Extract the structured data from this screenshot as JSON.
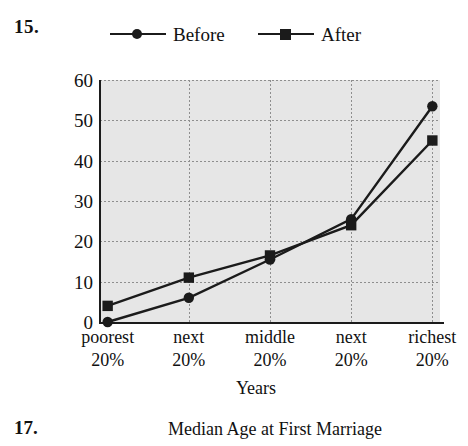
{
  "question_number": "15.",
  "legend": {
    "items": [
      {
        "label": "Before",
        "marker": "circle-marker-icon",
        "color": "#1b1b1b"
      },
      {
        "label": "After",
        "marker": "square-marker-icon",
        "color": "#1b1b1b"
      }
    ]
  },
  "axis": {
    "y_ticks": [
      "60",
      "50",
      "40",
      "30",
      "20",
      "10",
      "0"
    ],
    "x_title": "Years"
  },
  "x_categories": [
    {
      "line1": "poorest",
      "line2": "20%"
    },
    {
      "line1": "next",
      "line2": "20%"
    },
    {
      "line1": "middle",
      "line2": "20%"
    },
    {
      "line1": "next",
      "line2": "20%"
    },
    {
      "line1": "richest",
      "line2": "20%"
    }
  ],
  "footer": {
    "question_number": "17.",
    "title": "Median Age at First Marriage"
  },
  "colors": {
    "plot_background": "#e6e6e6",
    "line": "#1b1b1b",
    "gridline": "#8e8e8e",
    "axis": "#1b1b1b",
    "page_background": "#ffffff"
  },
  "chart_data": {
    "type": "line",
    "title": "",
    "xlabel": "Years",
    "ylabel": "",
    "categories": [
      "poorest 20%",
      "next 20%",
      "middle 20%",
      "next 20%",
      "richest 20%"
    ],
    "series": [
      {
        "name": "Before",
        "marker": "circle",
        "values": [
          0,
          6,
          15.5,
          25.5,
          53.5
        ]
      },
      {
        "name": "After",
        "marker": "square",
        "values": [
          4,
          11,
          16.5,
          24,
          45
        ]
      }
    ],
    "ylim": [
      0,
      60
    ],
    "yticks": [
      0,
      10,
      20,
      30,
      40,
      50,
      60
    ],
    "grid": true,
    "legend_position": "top"
  }
}
